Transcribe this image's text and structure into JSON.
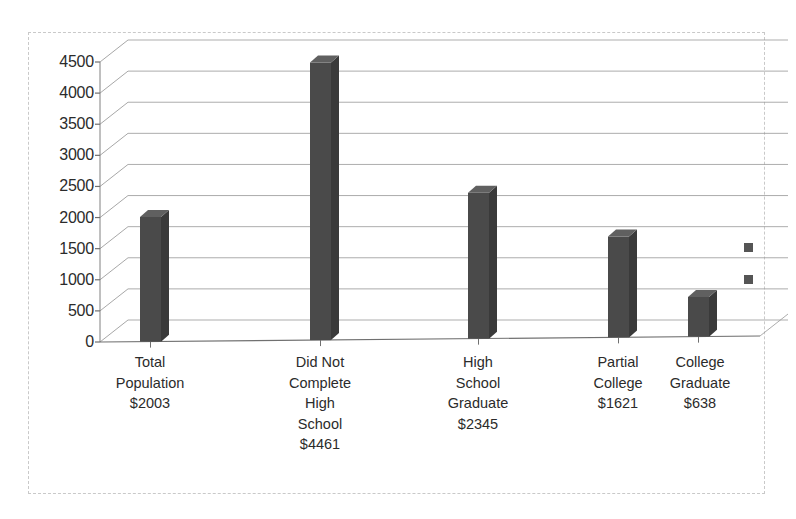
{
  "chart_data": {
    "type": "bar",
    "title": "",
    "subtitle": "",
    "xlabel": "",
    "ylabel": "",
    "categories": [
      "Total Population",
      "Did Not Complete High School",
      "High School Graduate",
      "Partial College",
      "College Graduate"
    ],
    "category_lines": [
      [
        "Total",
        "Population",
        "$2003"
      ],
      [
        "Did Not",
        "Complete",
        "High",
        "School",
        "$4461"
      ],
      [
        "High",
        "School",
        "Graduate",
        "$2345"
      ],
      [
        "Partial",
        "College",
        "$1621"
      ],
      [
        "College",
        "Graduate",
        "$638"
      ]
    ],
    "value_labels": [
      "$2003",
      "$4461",
      "$2345",
      "$1621",
      "$638"
    ],
    "values": [
      2003,
      4461,
      2345,
      1621,
      638
    ],
    "ylim": [
      0,
      4500
    ],
    "ytick_labels": [
      "4500",
      "4000",
      "3500",
      "3000",
      "2500",
      "2000",
      "1500",
      "1000",
      "500",
      "0"
    ],
    "yticks": [
      4500,
      4000,
      3500,
      3000,
      2500,
      2000,
      1500,
      1000,
      500,
      0
    ],
    "grid": true,
    "grid_axis": "y",
    "legend": "none",
    "style_3d": true,
    "bar_color": "#4a4a4a",
    "bar_side_color": "#3a3a3a",
    "bar_top_color": "#606060",
    "grid_color": "#999999",
    "axis_color": "#808080",
    "frame_color": "#c9c9c9",
    "marker_color": "#555555"
  },
  "markers": {
    "count": 2,
    "label": "legend-marker"
  }
}
